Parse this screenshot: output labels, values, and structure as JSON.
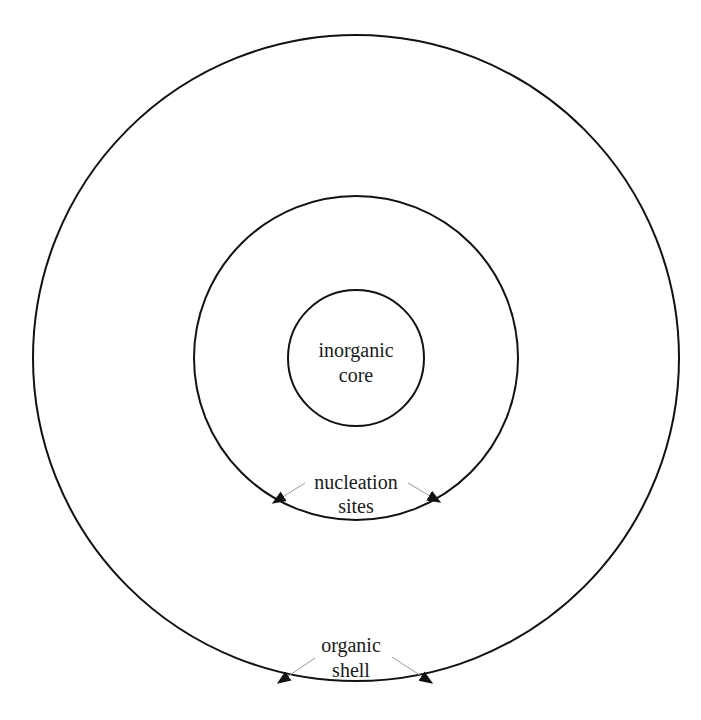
{
  "diagram": {
    "type": "concentric-particle-structure",
    "center": [
      356,
      358
    ],
    "circles": [
      {
        "name": "outer-shell-boundary",
        "r": 323
      },
      {
        "name": "nucleation-layer-boundary",
        "r": 162
      },
      {
        "name": "inorganic-core-boundary",
        "r": 68
      }
    ],
    "labels": {
      "core_line1": "inorganic",
      "core_line2": "core",
      "nucleation_line1": "nucleation",
      "nucleation_line2": "sites",
      "shell_line1": "organic",
      "shell_line2": "shell"
    },
    "colors": {
      "stroke": "#111111",
      "leader": "#9a9a9a",
      "text": "#1a1a1a",
      "background": "#ffffff"
    }
  }
}
